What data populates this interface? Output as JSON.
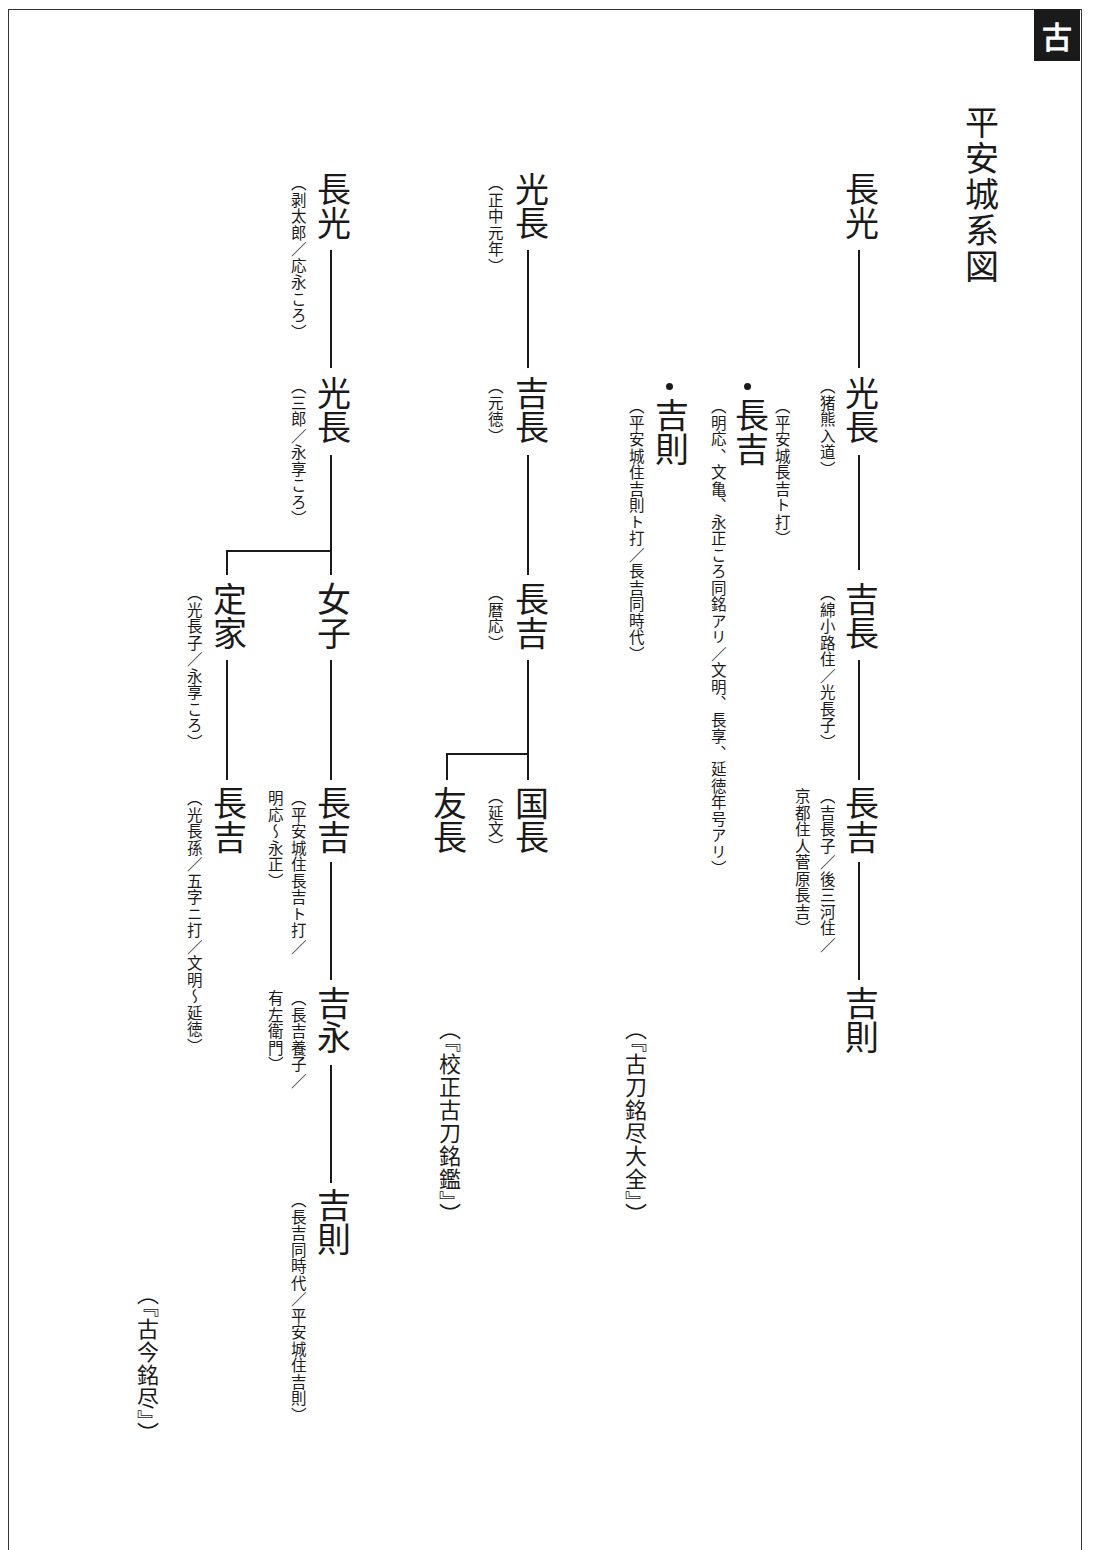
{
  "page_tab": "古",
  "title": "平安城系図",
  "lineage_1": {
    "root": "長光",
    "gen2": {
      "name": "光長",
      "note": "（猪熊入道）"
    },
    "gen3": {
      "name": "吉長",
      "note": "（綿小路住／光長子）"
    },
    "gen4": {
      "name": "長吉",
      "note_line1": "（吉長子／後三河住／",
      "note_line2": "京都住人菅原長吉）"
    },
    "gen5": {
      "name": "吉則"
    },
    "side_1": {
      "name": "長吉",
      "note": "（平安城長吉ト打）",
      "sub_note": "（明応、文亀、永正ころ同銘アリ／文明、長享、延徳年号アリ）"
    },
    "side_2": {
      "name": "吉則",
      "note": "（平安城住吉則ト打／長吉同時代）"
    },
    "source": "（『古刀銘尽大全』）"
  },
  "lineage_2": {
    "root": {
      "name": "光長",
      "note": "（正中元年）"
    },
    "gen2": {
      "name": "吉長",
      "note": "（元徳）"
    },
    "gen3": {
      "name": "長吉",
      "note": "（暦応）"
    },
    "child_1": {
      "name": "国長",
      "note": "（延文）"
    },
    "child_2": {
      "name": "友長"
    },
    "source": "（『校正古刀銘鑑』）"
  },
  "lineage_3": {
    "root": {
      "name": "長光",
      "note": "（剥太郎／応永ころ）"
    },
    "gen2": {
      "name": "光長",
      "note": "（三郎／永享ころ）"
    },
    "child_1": {
      "name": "女子"
    },
    "child_2": {
      "name": "定家",
      "note": "（光長子／永享ころ）"
    },
    "gen4_a": {
      "name": "長吉",
      "note_line1": "（平安城住長吉ト打／",
      "note_line2": "明応～永正）"
    },
    "gen5_a": {
      "name": "吉永",
      "note_line1": "（長吉養子／",
      "note_line2": "有左衛門）"
    },
    "gen6_a": {
      "name": "吉則",
      "note": "（長吉同時代／平安城住吉則）"
    },
    "gen4_b": {
      "name": "長吉",
      "note": "（光長孫／五字ニ打／文明～延徳）"
    },
    "source": "（『古今銘尽』）"
  }
}
